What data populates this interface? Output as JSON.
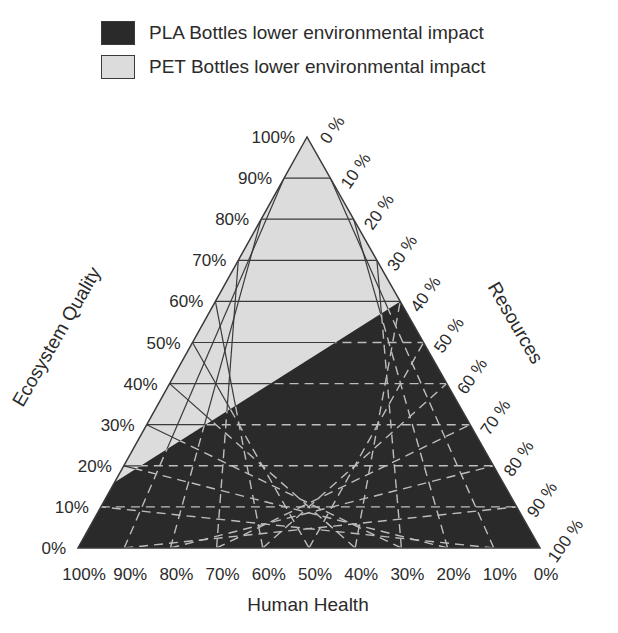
{
  "legend": {
    "items": [
      {
        "label": "PLA Bottles lower environmental impact",
        "color": "#2a2a2a"
      },
      {
        "label": "PET Bottles lower environmental impact",
        "color": "#dcdcdc"
      }
    ]
  },
  "chart_data": {
    "type": "ternary",
    "title": "",
    "axes": {
      "left": {
        "label": "Ecosystem Quality",
        "ticks": [
          "0%",
          "10%",
          "20%",
          "30%",
          "40%",
          "50%",
          "60%",
          "70%",
          "80%",
          "90%",
          "100%"
        ]
      },
      "right": {
        "label": "Resources",
        "ticks": [
          "0 %",
          "10 %",
          "20 %",
          "30 %",
          "40 %",
          "50 %",
          "60 %",
          "70 %",
          "80 %",
          "90 %",
          "100 %"
        ]
      },
      "bottom": {
        "label": "Human Health",
        "ticks": [
          "100%",
          "90%",
          "80%",
          "70%",
          "60%",
          "50%",
          "40%",
          "30%",
          "20%",
          "10%",
          "0%"
        ]
      }
    },
    "grid": "10% triangular grid",
    "regions": [
      {
        "name": "PET Bottles lower environmental impact",
        "color": "#dcdcdc",
        "position": "upper (high Ecosystem Quality weighting)"
      },
      {
        "name": "PLA Bottles lower environmental impact",
        "color": "#2a2a2a",
        "position": "lower"
      }
    ],
    "boundary_line": {
      "left_edge_ecosystem_quality": 16,
      "right_edge_resources": 40,
      "description": "Straight line separating regions, from ~16% Ecosystem Quality on left edge to ~40% Resources on right edge"
    }
  }
}
